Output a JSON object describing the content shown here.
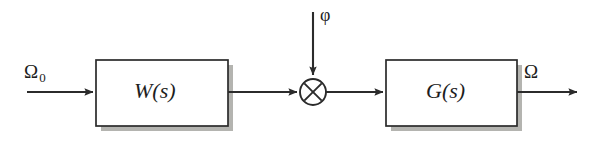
{
  "diagram": {
    "type": "control-block-diagram",
    "background_color": "#ffffff",
    "line_color": "#2b2b2b",
    "shadow_color": "#b0b0ac",
    "blocks": [
      {
        "id": "w-block",
        "label": "W(s)",
        "name": "controller-block",
        "x": 96,
        "y": 60,
        "width": 132,
        "height": 66
      },
      {
        "id": "g-block",
        "label": "G(s)",
        "name": "plant-block",
        "x": 386,
        "y": 60,
        "width": 131,
        "height": 66
      }
    ],
    "junction": {
      "id": "multiplier",
      "symbol": "cross-in-circle",
      "operation": "multiply",
      "cx": 313,
      "cy": 92,
      "r": 13
    },
    "signals": [
      {
        "id": "input-signal",
        "label": "Ω",
        "subscript": "0",
        "name": "input-signal-omega-zero",
        "role": "reference input"
      },
      {
        "id": "disturbance-signal",
        "label": "φ",
        "name": "disturbance-signal-phi",
        "role": "external input"
      },
      {
        "id": "output-signal",
        "label": "Ω",
        "name": "output-signal-omega",
        "role": "output"
      }
    ],
    "connections": [
      {
        "id": "in-to-w",
        "from": "input-signal",
        "to": "w-block",
        "orientation": "horizontal",
        "arrow": true
      },
      {
        "id": "w-to-mult",
        "from": "w-block",
        "to": "multiplier",
        "orientation": "horizontal",
        "arrow": true
      },
      {
        "id": "phi-to-mult",
        "from": "disturbance-signal",
        "to": "multiplier",
        "orientation": "vertical",
        "arrow": true
      },
      {
        "id": "mult-to-g",
        "from": "multiplier",
        "to": "g-block",
        "orientation": "horizontal",
        "arrow": true
      },
      {
        "id": "g-to-out",
        "from": "g-block",
        "to": "output-signal",
        "orientation": "horizontal",
        "arrow": true
      }
    ]
  }
}
